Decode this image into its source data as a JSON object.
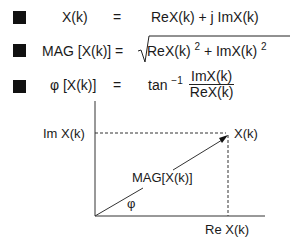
{
  "equations": [
    {
      "lhs": "X(k)",
      "eq": "=",
      "rhs": "ReX(k) + j ImX(k)"
    },
    {
      "lhs": "MAG [X(k)] =",
      "rhs_a": "ReX(k)",
      "exp_a": "2",
      "rhs_plus": "+ ImX(k)",
      "exp_b": "2"
    },
    {
      "lhs": "φ [X(k)]",
      "eq": "=",
      "func": "tan",
      "exp": "−1",
      "numerator": "ImX(k)",
      "denominator": "ReX(k)"
    }
  ],
  "diagram": {
    "y_label": "Im X(k)",
    "x_label": "Re X(k)",
    "point_label": "X(k)",
    "vector_label": "MAG[X(k)]",
    "angle_label": "φ"
  }
}
